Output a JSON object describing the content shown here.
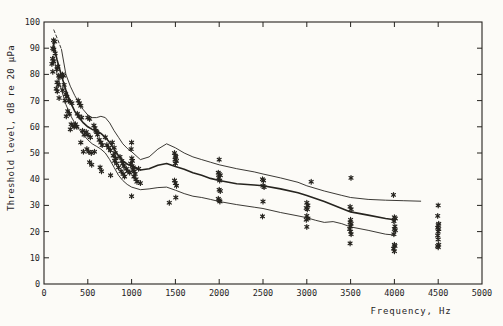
{
  "figure": {
    "background": "#fcfbf7",
    "ink": "#26241f"
  },
  "chart_data": {
    "type": "scatter",
    "title": "",
    "xlabel": "Frequency, Hz",
    "ylabel": "Threshold level, dB re 20 µPa",
    "xlim": [
      0,
      5000
    ],
    "ylim": [
      0,
      100
    ],
    "x_ticks": [
      0,
      500,
      1000,
      1500,
      2000,
      2500,
      3000,
      3500,
      4000,
      4500,
      5000
    ],
    "y_ticks": [
      0,
      10,
      20,
      30,
      40,
      50,
      60,
      70,
      80,
      90,
      100
    ],
    "grid": false,
    "legend": "none",
    "marker": "asterisk",
    "series": [
      {
        "name": "upper-bound-lead-dashed",
        "style": "dashed",
        "points": [
          [
            112,
            97
          ],
          [
            160,
            93
          ],
          [
            200,
            89.5
          ]
        ]
      },
      {
        "name": "upper-bound-curve",
        "style": "thin",
        "points": [
          [
            200,
            89.5
          ],
          [
            250,
            80
          ],
          [
            300,
            75.5
          ],
          [
            350,
            72
          ],
          [
            400,
            69
          ],
          [
            450,
            66.5
          ],
          [
            500,
            64.5
          ],
          [
            550,
            63.5
          ],
          [
            600,
            63.5
          ],
          [
            650,
            64
          ],
          [
            700,
            63.5
          ],
          [
            750,
            61.5
          ],
          [
            800,
            58.5
          ],
          [
            850,
            56
          ],
          [
            900,
            53.5
          ],
          [
            950,
            51.8
          ],
          [
            1000,
            50.5
          ],
          [
            1100,
            47.5
          ],
          [
            1200,
            48.5
          ],
          [
            1300,
            51.5
          ],
          [
            1400,
            53.5
          ],
          [
            1500,
            52
          ],
          [
            1600,
            50
          ],
          [
            1700,
            48.5
          ],
          [
            1800,
            47.5
          ],
          [
            1900,
            46.5
          ],
          [
            2000,
            45.5
          ],
          [
            2200,
            44
          ],
          [
            2400,
            42.8
          ],
          [
            2500,
            42
          ],
          [
            2700,
            40.5
          ],
          [
            2900,
            38.8
          ],
          [
            3000,
            37.5
          ],
          [
            3200,
            35.5
          ],
          [
            3400,
            33.8
          ],
          [
            3500,
            33
          ],
          [
            3700,
            32.3
          ],
          [
            3900,
            32
          ],
          [
            4100,
            31.8
          ],
          [
            4300,
            31.6
          ]
        ]
      },
      {
        "name": "mean-threshold-curve",
        "style": "thick",
        "points": [
          [
            105,
            92
          ],
          [
            150,
            85.5
          ],
          [
            200,
            79.5
          ],
          [
            250,
            74
          ],
          [
            300,
            69.5
          ],
          [
            350,
            66
          ],
          [
            400,
            63.5
          ],
          [
            450,
            61.5
          ],
          [
            500,
            60
          ],
          [
            550,
            59
          ],
          [
            600,
            58.5
          ],
          [
            650,
            57.5
          ],
          [
            700,
            56
          ],
          [
            750,
            54
          ],
          [
            800,
            51.5
          ],
          [
            850,
            49
          ],
          [
            900,
            47
          ],
          [
            950,
            45.8
          ],
          [
            1000,
            45
          ],
          [
            1100,
            43.5
          ],
          [
            1200,
            44
          ],
          [
            1300,
            45.3
          ],
          [
            1400,
            46
          ],
          [
            1500,
            44.8
          ],
          [
            1600,
            43.8
          ],
          [
            1700,
            42.5
          ],
          [
            1800,
            41.5
          ],
          [
            1900,
            40.3
          ],
          [
            2000,
            39.5
          ],
          [
            2200,
            38.3
          ],
          [
            2400,
            37.8
          ],
          [
            2500,
            37.5
          ],
          [
            2700,
            36.3
          ],
          [
            2900,
            34.8
          ],
          [
            3000,
            33.8
          ],
          [
            3200,
            31.5
          ],
          [
            3400,
            28.8
          ],
          [
            3500,
            27.5
          ],
          [
            3700,
            26.3
          ],
          [
            3900,
            25
          ],
          [
            4000,
            24.5
          ]
        ]
      },
      {
        "name": "lower-bound-curve",
        "style": "thin",
        "points": [
          [
            110,
            87
          ],
          [
            150,
            80
          ],
          [
            200,
            74
          ],
          [
            250,
            68.5
          ],
          [
            300,
            64.5
          ],
          [
            350,
            61.5
          ],
          [
            400,
            59
          ],
          [
            450,
            57
          ],
          [
            500,
            55
          ],
          [
            550,
            53.5
          ],
          [
            600,
            52.5
          ],
          [
            650,
            51.5
          ],
          [
            700,
            50
          ],
          [
            750,
            47.5
          ],
          [
            800,
            44.5
          ],
          [
            850,
            41.5
          ],
          [
            900,
            39.5
          ],
          [
            950,
            38
          ],
          [
            1000,
            37
          ],
          [
            1100,
            36
          ],
          [
            1200,
            36.3
          ],
          [
            1300,
            36.8
          ],
          [
            1400,
            37
          ],
          [
            1500,
            35.8
          ],
          [
            1600,
            34.5
          ],
          [
            1700,
            33.5
          ],
          [
            1800,
            33
          ],
          [
            1900,
            32.3
          ],
          [
            2000,
            31.5
          ],
          [
            2200,
            30.3
          ],
          [
            2400,
            29.3
          ],
          [
            2500,
            28.8
          ],
          [
            2700,
            27.3
          ],
          [
            2900,
            26
          ],
          [
            3000,
            25.3
          ],
          [
            3100,
            24.3
          ],
          [
            3200,
            23.5
          ],
          [
            3300,
            23.8
          ],
          [
            3400,
            23
          ],
          [
            3500,
            21.8
          ],
          [
            3700,
            20.5
          ],
          [
            3900,
            19
          ],
          [
            4000,
            18.7
          ]
        ]
      }
    ],
    "scatter_points": [
      [
        110,
        93
      ],
      [
        122,
        92.5
      ],
      [
        100,
        90
      ],
      [
        112,
        89.5
      ],
      [
        128,
        88
      ],
      [
        98,
        86
      ],
      [
        110,
        85
      ],
      [
        90,
        84
      ],
      [
        100,
        81
      ],
      [
        158,
        83
      ],
      [
        148,
        82
      ],
      [
        168,
        79.5
      ],
      [
        182,
        79
      ],
      [
        150,
        77
      ],
      [
        162,
        76
      ],
      [
        140,
        74.5
      ],
      [
        152,
        73.5
      ],
      [
        172,
        71
      ],
      [
        210,
        80
      ],
      [
        224,
        79.5
      ],
      [
        230,
        76
      ],
      [
        214,
        74
      ],
      [
        248,
        72.5
      ],
      [
        260,
        71.5
      ],
      [
        240,
        70
      ],
      [
        280,
        70
      ],
      [
        300,
        69.5
      ],
      [
        318,
        69
      ],
      [
        270,
        66
      ],
      [
        290,
        65
      ],
      [
        255,
        64
      ],
      [
        310,
        61
      ],
      [
        328,
        60.5
      ],
      [
        344,
        60
      ],
      [
        300,
        59
      ],
      [
        390,
        70
      ],
      [
        404,
        69
      ],
      [
        420,
        68
      ],
      [
        380,
        65
      ],
      [
        400,
        64
      ],
      [
        430,
        63.5
      ],
      [
        360,
        61
      ],
      [
        376,
        60
      ],
      [
        440,
        58.5
      ],
      [
        458,
        57
      ],
      [
        420,
        54
      ],
      [
        450,
        50.5
      ],
      [
        500,
        63.5
      ],
      [
        520,
        63
      ],
      [
        482,
        58
      ],
      [
        500,
        57
      ],
      [
        530,
        56
      ],
      [
        490,
        51.5
      ],
      [
        510,
        50.5
      ],
      [
        540,
        50
      ],
      [
        520,
        46.5
      ],
      [
        545,
        45.5
      ],
      [
        570,
        60.5
      ],
      [
        582,
        59.5
      ],
      [
        592,
        58.5
      ],
      [
        602,
        58
      ],
      [
        612,
        57
      ],
      [
        576,
        50.5
      ],
      [
        630,
        55
      ],
      [
        650,
        54
      ],
      [
        664,
        53
      ],
      [
        640,
        44.5
      ],
      [
        656,
        43
      ],
      [
        700,
        56
      ],
      [
        718,
        53
      ],
      [
        738,
        52
      ],
      [
        758,
        51
      ],
      [
        760,
        41.5
      ],
      [
        780,
        54
      ],
      [
        800,
        52
      ],
      [
        812,
        50
      ],
      [
        790,
        49
      ],
      [
        820,
        48
      ],
      [
        806,
        47
      ],
      [
        830,
        46
      ],
      [
        850,
        44.5
      ],
      [
        868,
        48.5
      ],
      [
        888,
        47
      ],
      [
        900,
        46
      ],
      [
        912,
        45
      ],
      [
        880,
        43
      ],
      [
        904,
        42
      ],
      [
        920,
        41
      ],
      [
        940,
        44
      ],
      [
        958,
        43
      ],
      [
        978,
        42.5
      ],
      [
        995,
        51.5
      ],
      [
        1000,
        54
      ],
      [
        1002,
        48
      ],
      [
        1010,
        47
      ],
      [
        990,
        46
      ],
      [
        1006,
        45
      ],
      [
        1020,
        44.5
      ],
      [
        1016,
        43.5
      ],
      [
        1030,
        43
      ],
      [
        1040,
        42
      ],
      [
        1026,
        41
      ],
      [
        1050,
        40
      ],
      [
        1062,
        39
      ],
      [
        1080,
        44
      ],
      [
        1100,
        38.5
      ],
      [
        1000,
        33.5
      ],
      [
        1430,
        31
      ],
      [
        1490,
        50
      ],
      [
        1500,
        49
      ],
      [
        1506,
        48.5
      ],
      [
        1496,
        47.5
      ],
      [
        1512,
        47
      ],
      [
        1500,
        46
      ],
      [
        1490,
        39.5
      ],
      [
        1500,
        38.5
      ],
      [
        1512,
        37.5
      ],
      [
        1505,
        33
      ],
      [
        2000,
        47.5
      ],
      [
        1990,
        42.5
      ],
      [
        2000,
        42
      ],
      [
        2012,
        41.5
      ],
      [
        1994,
        40.5
      ],
      [
        2006,
        39.5
      ],
      [
        2000,
        36
      ],
      [
        2012,
        35.5
      ],
      [
        1990,
        32.5
      ],
      [
        2000,
        32
      ],
      [
        2008,
        31.5
      ],
      [
        2494,
        40
      ],
      [
        2506,
        39.5
      ],
      [
        2500,
        37.5
      ],
      [
        2512,
        37
      ],
      [
        2500,
        31.5
      ],
      [
        2494,
        25.8
      ],
      [
        3050,
        39
      ],
      [
        3000,
        31
      ],
      [
        3012,
        30
      ],
      [
        2994,
        29
      ],
      [
        3006,
        28.5
      ],
      [
        3000,
        26
      ],
      [
        3012,
        25
      ],
      [
        2994,
        24.5
      ],
      [
        3000,
        21.8
      ],
      [
        3505,
        40.5
      ],
      [
        3494,
        29.5
      ],
      [
        3506,
        28.5
      ],
      [
        3500,
        24.5
      ],
      [
        3494,
        23.5
      ],
      [
        3506,
        23
      ],
      [
        3500,
        22
      ],
      [
        3490,
        21
      ],
      [
        3500,
        20
      ],
      [
        3506,
        19
      ],
      [
        3494,
        15.5
      ],
      [
        3990,
        34
      ],
      [
        4000,
        25.5
      ],
      [
        4010,
        25
      ],
      [
        3994,
        24
      ],
      [
        4006,
        22
      ],
      [
        4000,
        21
      ],
      [
        4010,
        20.5
      ],
      [
        3994,
        19
      ],
      [
        4000,
        15
      ],
      [
        4006,
        14.5
      ],
      [
        3990,
        13.5
      ],
      [
        4000,
        12.5
      ],
      [
        4500,
        30
      ],
      [
        4494,
        26
      ],
      [
        4506,
        23
      ],
      [
        4500,
        22.5
      ],
      [
        4494,
        21.5
      ],
      [
        4506,
        21
      ],
      [
        4500,
        20
      ],
      [
        4494,
        18.5
      ],
      [
        4500,
        17
      ],
      [
        4506,
        15
      ],
      [
        4494,
        14.5
      ],
      [
        4500,
        14
      ]
    ]
  }
}
